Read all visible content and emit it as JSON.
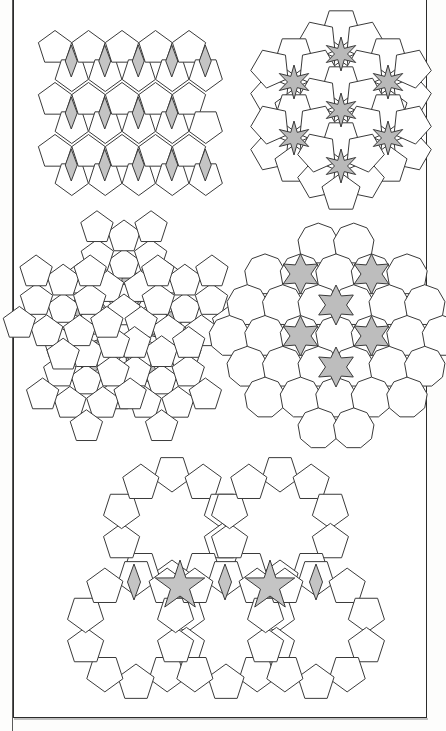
{
  "page": {
    "background_color": "#fdfdfc",
    "paper_color": "#ffffff",
    "frame": {
      "stroke_color": "#2b2b2b",
      "x": 13,
      "y": -2,
      "width": 414,
      "height": 720,
      "left_rule_x": 12
    }
  },
  "style": {
    "tile_fill": "#ffffff",
    "tile_stroke": "#3a3a3a",
    "stroke_width": 1,
    "gap_fill_dark": "#b4b4b4",
    "gap_fill_mid": "#c4c4c4",
    "gap_fill_light": "#d2d2d2"
  },
  "figures": [
    {
      "id": "fig-1",
      "name": "pentagon-rhombus-tiling",
      "caption": "",
      "position": {
        "x": 33,
        "y": 24,
        "width": 180,
        "height": 162
      },
      "tile_shape": "pentagon",
      "gap_shape": "rhombus",
      "gap_count": 14,
      "rows": 3,
      "columns": 5,
      "gap_fill": "#c4c4c4",
      "symmetry": "p2 — rows of pentagons separated by thin rhombic gaps"
    },
    {
      "id": "fig-2",
      "name": "pentagon-six-point-star-tiling",
      "caption": "",
      "position": {
        "x": 250,
        "y": 22,
        "width": 180,
        "height": 165
      },
      "tile_shape": "pentagon",
      "gap_shape": "six-pointed-star",
      "gap_count": 7,
      "gap_fill": "#b9b9b9",
      "symmetry": "hexagonal clusters of pentagons around star-shaped gaps"
    },
    {
      "id": "fig-3",
      "name": "pentagon-pinwheel-tiling",
      "caption": "",
      "position": {
        "x": 22,
        "y": 218,
        "width": 200,
        "height": 222
      },
      "tile_shape": "pentagon",
      "gap_shape": "pinwheel-spiral",
      "gap_count": 5,
      "gap_fill": "#c0c0c0",
      "symmetry": "five-fold pinwheel of pentagon rosettes"
    },
    {
      "id": "fig-4",
      "name": "nonagon-star-packing",
      "caption": "",
      "position": {
        "x": 240,
        "y": 238,
        "width": 192,
        "height": 196
      },
      "tile_shape": "nonagon",
      "gap_shape": "six-pointed-star",
      "gap_count": 6,
      "tile_count": 31,
      "gap_fill": "#bdbdbd",
      "symmetry": "hexagonal close packing of nonagons with star interstices"
    },
    {
      "id": "fig-5",
      "name": "decagon-ring-star-tiling",
      "caption": "",
      "position": {
        "x": 86,
        "y": 462,
        "width": 280,
        "height": 230
      },
      "tile_shape": "pentagon",
      "gap_shape": "decagon-hole-and-five-point-star",
      "decagon_holes": 5,
      "star_gaps": 2,
      "rhombus_gaps": 4,
      "gap_fill": "#c4c4c4",
      "symmetry": "rings of ten pentagons around decagonal holes"
    }
  ]
}
